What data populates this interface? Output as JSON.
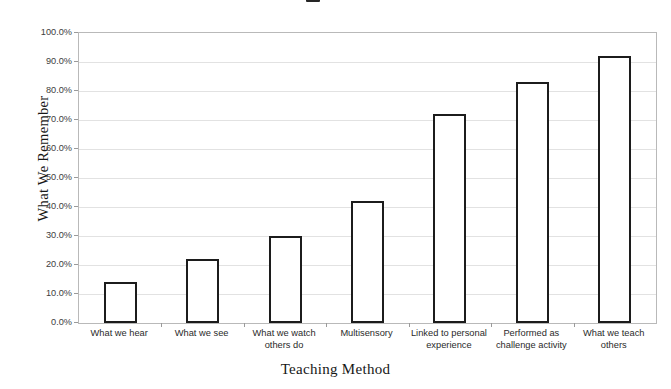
{
  "chart_data": {
    "type": "bar",
    "title": "",
    "xlabel": "Teaching Method",
    "ylabel": "What We Remember",
    "categories": [
      "What we hear",
      "What we see",
      "What we watch others do",
      "Multisensory",
      "Linked to personal experience",
      "Performed as challenge activity",
      "What we teach others"
    ],
    "values": [
      14,
      22,
      30,
      42,
      72,
      83,
      92
    ],
    "value_labels": [
      "14.0%",
      "22.0%",
      "30.0%",
      "42.0%",
      "72.0%",
      "83.0%",
      "92.0%"
    ],
    "ylim": [
      0,
      100
    ],
    "ytick_labels": [
      "100.0%",
      "90.0%",
      "80.0%",
      "70.0%",
      "60.0%",
      "50.0%",
      "40.0%",
      "30.0%",
      "20.0%",
      "10.0%",
      "0.0%"
    ],
    "ytick_values": [
      100,
      90,
      80,
      70,
      60,
      50,
      40,
      30,
      20,
      10,
      0
    ],
    "grid": true,
    "legend": false,
    "legend_position": "none",
    "bar_fill_color": "#ffffff",
    "bar_border_color": "#1c1c1c",
    "gridline_color": "#e2e2e2",
    "axis_color": "#b9b9b9",
    "background_color": "#ffffff"
  }
}
